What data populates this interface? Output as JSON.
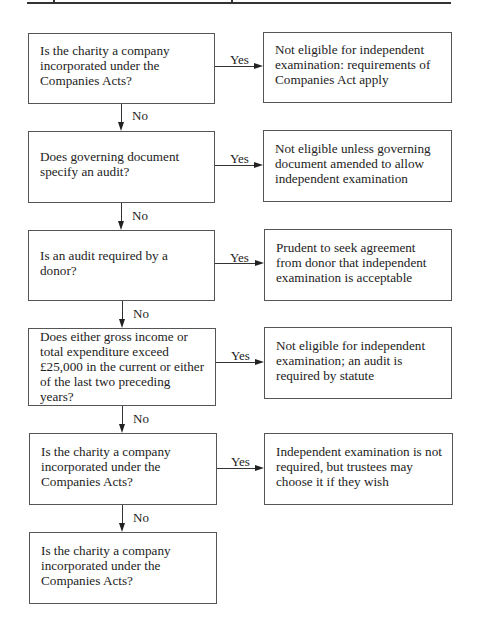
{
  "header": {
    "rule": true
  },
  "flowchart": {
    "questions": [
      {
        "text": "Is the charity a company\nincorporated under the\nCompanies Acts?"
      },
      {
        "text": "Does governing document\nspecify an audit?"
      },
      {
        "text": "Is an audit required by a donor?"
      },
      {
        "text": "Does either gross income or\ntotal expenditure exceed\n£25,000 in the current or either\nof the last two preceding years?"
      },
      {
        "text": "Is the charity a company\nincorporated under the\nCompanies Acts?"
      },
      {
        "text": "Is the charity a company\nincorporated under the\nCompanies Acts?"
      }
    ],
    "outcomes": [
      {
        "text": "Not eligible for independent\nexamination: requirements of\nCompanies Act apply"
      },
      {
        "text": "Not eligible unless governing\ndocument amended to allow\nindependent examination"
      },
      {
        "text": "Prudent to seek agreement\nfrom donor that independent\nexamination is acceptable"
      },
      {
        "text": "Not eligible for independent\nexamination; an audit is\nrequired by statute"
      },
      {
        "text": "Independent examination is not\nrequired, but trustees may\nchoose it if they wish"
      }
    ],
    "yes_label": "Yes",
    "no_label": "No"
  }
}
